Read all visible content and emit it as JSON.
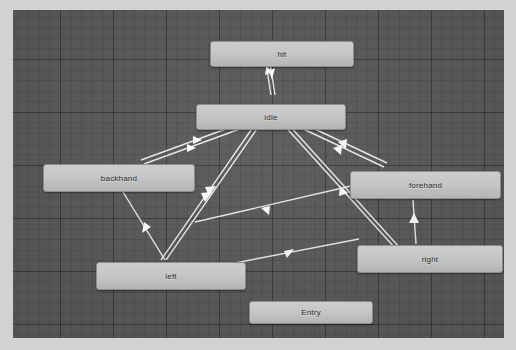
{
  "window": {
    "kind": "animator-state-machine-graph",
    "canvas_background_color": "#5b5b5b",
    "node_fill_color": "#c6c6c6",
    "node_border_color": "#8e8e8e",
    "transition_color": "#ffffff",
    "label_color": "#2b2b2b"
  },
  "graph": {
    "nodes": [
      {
        "id": "hit",
        "label": "hit",
        "x": 197,
        "y": 31,
        "w": 144,
        "h": 26
      },
      {
        "id": "idle",
        "label": "idle",
        "x": 183,
        "y": 94,
        "w": 150,
        "h": 26
      },
      {
        "id": "backhand",
        "label": "backhand",
        "x": 30,
        "y": 154,
        "w": 152,
        "h": 28
      },
      {
        "id": "forehand",
        "label": "forehand",
        "x": 337,
        "y": 161,
        "w": 151,
        "h": 28
      },
      {
        "id": "right",
        "label": "right",
        "x": 344,
        "y": 235,
        "w": 146,
        "h": 28
      },
      {
        "id": "left",
        "label": "left",
        "x": 83,
        "y": 252,
        "w": 150,
        "h": 28
      },
      {
        "id": "Entry",
        "label": "Entry",
        "x": 236,
        "y": 291,
        "w": 124,
        "h": 23
      }
    ],
    "transitions": [
      {
        "from": "idle",
        "to": "hit",
        "arrow": "up"
      },
      {
        "from": "hit",
        "to": "idle",
        "arrow": "down"
      },
      {
        "from": "idle",
        "to": "backhand",
        "arrow": "left"
      },
      {
        "from": "backhand",
        "to": "idle",
        "arrow": "left"
      },
      {
        "from": "idle",
        "to": "forehand",
        "arrow": "up-left"
      },
      {
        "from": "forehand",
        "to": "idle",
        "arrow": "up-left"
      },
      {
        "from": "idle",
        "to": "left",
        "arrow": "down-left"
      },
      {
        "from": "left",
        "to": "idle",
        "arrow": "down-left"
      },
      {
        "from": "idle",
        "to": "right",
        "arrow": "left"
      },
      {
        "from": "left",
        "to": "backhand",
        "arrow": "up-left"
      },
      {
        "from": "left",
        "to": "right",
        "arrow": "right"
      },
      {
        "from": "right",
        "to": "forehand",
        "arrow": "up"
      }
    ]
  }
}
